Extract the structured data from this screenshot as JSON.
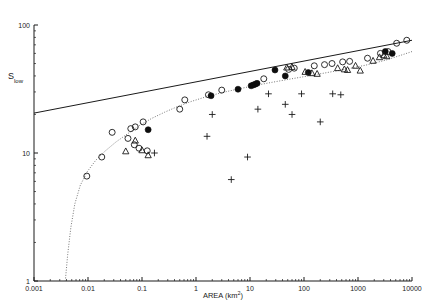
{
  "chart_data": {
    "type": "scatter",
    "title": "",
    "xlabel": "AREA (km2)",
    "xlabel_base": "AREA (km",
    "xlabel_sup": "2",
    "xlabel_tail": ")",
    "ylabel": "Slow",
    "ylabel_main": "S",
    "ylabel_sub": "low",
    "xscale": "log",
    "yscale": "log",
    "xlim": [
      0.001,
      10000
    ],
    "ylim": [
      1,
      100
    ],
    "grid": false,
    "legend": "none",
    "xticks": [
      0.001,
      0.01,
      0.1,
      1,
      10,
      100,
      1000,
      10000
    ],
    "xtick_labels": [
      "0.001",
      "0.01",
      "0.1",
      "1",
      "10",
      "100",
      "1000",
      "10000"
    ],
    "yticks": [
      1,
      10,
      100
    ],
    "ytick_labels": [
      "1",
      "10",
      "100"
    ],
    "series": [
      {
        "name": "open-circle",
        "marker": "open-circle",
        "color": "#1a1a1a",
        "points": [
          [
            0.0095,
            6.6
          ],
          [
            0.018,
            9.3
          ],
          [
            0.028,
            14.5
          ],
          [
            0.055,
            13.0
          ],
          [
            0.062,
            15.5
          ],
          [
            0.072,
            11.6
          ],
          [
            0.075,
            16.0
          ],
          [
            0.088,
            10.9
          ],
          [
            0.105,
            17.5
          ],
          [
            0.125,
            10.4
          ],
          [
            0.5,
            22.0
          ],
          [
            0.62,
            26.0
          ],
          [
            1.7,
            28.5
          ],
          [
            3.0,
            31.0
          ],
          [
            18.0,
            38.0
          ],
          [
            52.0,
            45.0
          ],
          [
            66.0,
            46.0
          ],
          [
            155.0,
            48.0
          ],
          [
            240.0,
            49.0
          ],
          [
            330.0,
            50.0
          ],
          [
            520.0,
            51.5
          ],
          [
            700.0,
            52.0
          ],
          [
            1500.0,
            55.0
          ],
          [
            2600.0,
            60.0
          ],
          [
            3600.0,
            62.0
          ],
          [
            5200.0,
            72.0
          ],
          [
            8000.0,
            76.0
          ]
        ]
      },
      {
        "name": "filled-circle",
        "marker": "filled-circle",
        "color": "#0d0d0d",
        "points": [
          [
            0.13,
            15.2
          ],
          [
            1.9,
            28.0
          ],
          [
            6.0,
            31.5
          ],
          [
            10.5,
            33.5
          ],
          [
            11.5,
            34.0
          ],
          [
            12.5,
            34.5
          ],
          [
            13.5,
            35.0
          ],
          [
            29.0,
            44.5
          ],
          [
            45.0,
            40.0
          ],
          [
            120.0,
            42.5
          ],
          [
            3200.0,
            62.0
          ],
          [
            4300.0,
            60.0
          ]
        ]
      },
      {
        "name": "triangle",
        "marker": "triangle",
        "color": "#1a1a1a",
        "points": [
          [
            0.05,
            10.3
          ],
          [
            0.075,
            12.5
          ],
          [
            0.1,
            10.5
          ],
          [
            0.13,
            9.6
          ],
          [
            48.0,
            46.5
          ],
          [
            60.0,
            47.0
          ],
          [
            105.0,
            43.0
          ],
          [
            140.0,
            42.0
          ],
          [
            175.0,
            41.5
          ],
          [
            420.0,
            46.0
          ],
          [
            560.0,
            45.0
          ],
          [
            640.0,
            44.5
          ],
          [
            900.0,
            48.0
          ],
          [
            1100.0,
            44.0
          ],
          [
            1900.0,
            52.5
          ],
          [
            2500.0,
            56.0
          ],
          [
            3000.0,
            58.0
          ],
          [
            3400.0,
            57.0
          ]
        ]
      },
      {
        "name": "plus",
        "marker": "plus",
        "color": "#1a1a1a",
        "points": [
          [
            0.17,
            10.0
          ],
          [
            1.6,
            13.5
          ],
          [
            2.0,
            20.0
          ],
          [
            4.5,
            6.2
          ],
          [
            9.0,
            9.3
          ],
          [
            14.0,
            22.0
          ],
          [
            22.0,
            29.0
          ],
          [
            45.0,
            24.0
          ],
          [
            60.0,
            20.0
          ],
          [
            90.0,
            29.0
          ],
          [
            200.0,
            17.5
          ],
          [
            340.0,
            29.0
          ],
          [
            480.0,
            28.5
          ]
        ]
      }
    ],
    "fit_line": {
      "name": "regression-line",
      "style": "solid",
      "points": [
        [
          0.001,
          20.5
        ],
        [
          10000.0,
          76.0
        ]
      ]
    },
    "model_curve": {
      "name": "model-curve",
      "style": "dotted",
      "points": [
        [
          0.0038,
          1.0
        ],
        [
          0.0042,
          1.6
        ],
        [
          0.0048,
          2.6
        ],
        [
          0.0057,
          4.0
        ],
        [
          0.0072,
          5.6
        ],
        [
          0.0098,
          7.2
        ],
        [
          0.014,
          8.8
        ],
        [
          0.021,
          10.4
        ],
        [
          0.033,
          12.2
        ],
        [
          0.055,
          14.2
        ],
        [
          0.09,
          16.4
        ],
        [
          0.15,
          18.6
        ],
        [
          0.26,
          20.8
        ],
        [
          0.45,
          23.0
        ],
        [
          0.8,
          25.2
        ],
        [
          1.5,
          27.4
        ],
        [
          3.0,
          29.6
        ],
        [
          6.0,
          31.6
        ],
        [
          12.0,
          33.6
        ],
        [
          25.0,
          35.6
        ],
        [
          55.0,
          37.8
        ],
        [
          120.0,
          40.0
        ],
        [
          260.0,
          42.4
        ],
        [
          600.0,
          45.2
        ],
        [
          1400.0,
          48.6
        ],
        [
          3200.0,
          53.0
        ],
        [
          7000.0,
          59.0
        ],
        [
          10000.0,
          62.0
        ]
      ]
    }
  }
}
